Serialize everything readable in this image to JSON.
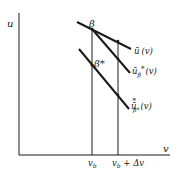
{
  "diagram": {
    "axes": {
      "y_label": "u",
      "x_label": "v"
    },
    "points": {
      "beta": "β",
      "beta_star": "β*"
    },
    "curves": [
      {
        "id": "u_bar",
        "label_main": "ū",
        "label_sub": "",
        "label_sup": "",
        "label_arg": "(v)"
      },
      {
        "id": "u_bar_beta_star",
        "label_main": "ū",
        "label_sub": "β",
        "label_sup": "*",
        "label_arg": "(v)"
      },
      {
        "id": "u_bar_star_beta_star",
        "label_main": "ū",
        "label_sub": "β*",
        "label_sup": "*",
        "label_arg": "(v)"
      }
    ],
    "x_ticks": {
      "vb": "v",
      "vb_sub": "b",
      "vb_plus_dv": "v",
      "vb_plus_dv_sub": "b",
      "vb_plus_dv_rest": " + Δv"
    },
    "colors": {
      "line": "#1a1a1a",
      "background": "#ffffff"
    }
  }
}
